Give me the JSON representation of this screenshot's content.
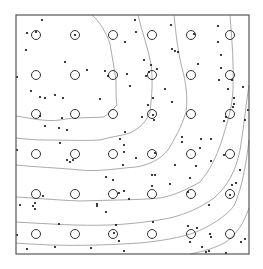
{
  "chart_data": {
    "type": "scatter",
    "title": "",
    "xlabel": "",
    "ylabel": "",
    "grid": false,
    "legend": null,
    "frame": {
      "x0": 16,
      "y0": 15,
      "x1": 249,
      "y1": 254,
      "color": "#555555"
    },
    "colors": {
      "points": "#111111",
      "circles": "#333333",
      "contours": "#a0a0a0"
    },
    "sample_grid": {
      "columns_px": [
        36,
        75,
        113,
        152,
        191,
        230
      ],
      "rows_px": [
        35,
        75,
        114,
        154,
        194,
        234
      ],
      "marker": "open-circle",
      "radius_px": 4.5
    },
    "series": [
      {
        "name": "points",
        "marker": "dot",
        "points_px": [
          [
            42,
            20
          ],
          [
            27,
            33
          ],
          [
            36,
            32
          ],
          [
            75,
            35
          ],
          [
            26,
            50
          ],
          [
            65,
            62
          ],
          [
            17,
            77
          ],
          [
            87,
            70
          ],
          [
            105,
            71
          ],
          [
            108,
            76
          ],
          [
            127,
            74
          ],
          [
            130,
            86
          ],
          [
            31,
            91
          ],
          [
            40,
            97
          ],
          [
            45,
            98
          ],
          [
            55,
            95
          ],
          [
            63,
            98
          ],
          [
            100,
            99
          ],
          [
            40,
            116
          ],
          [
            62,
            118
          ],
          [
            45,
            126
          ],
          [
            59,
            128
          ],
          [
            67,
            130
          ],
          [
            125,
            132
          ],
          [
            125,
            42
          ],
          [
            136,
            32
          ],
          [
            135,
            20
          ],
          [
            171,
            25
          ],
          [
            172,
            49
          ],
          [
            175,
            51
          ],
          [
            178,
            52
          ],
          [
            157,
            69
          ],
          [
            151,
            65
          ],
          [
            149,
            72
          ],
          [
            144,
            60
          ],
          [
            146,
            76
          ],
          [
            153,
            98
          ],
          [
            172,
            102
          ],
          [
            148,
            105
          ],
          [
            142,
            117
          ],
          [
            153,
            115
          ],
          [
            154,
            120
          ],
          [
            165,
            89
          ],
          [
            194,
            34
          ],
          [
            198,
            64
          ],
          [
            218,
            26
          ],
          [
            218,
            42
          ],
          [
            221,
            55
          ],
          [
            221,
            68
          ],
          [
            219,
            80
          ],
          [
            228,
            89
          ],
          [
            232,
            80
          ],
          [
            234,
            98
          ],
          [
            243,
            87
          ],
          [
            245,
            120
          ],
          [
            226,
            117
          ],
          [
            224,
            121
          ],
          [
            233,
            107
          ],
          [
            234,
            104
          ],
          [
            60,
            143
          ],
          [
            120,
            139
          ],
          [
            124,
            145
          ],
          [
            124,
            152
          ],
          [
            73,
            160
          ],
          [
            70,
            162
          ],
          [
            67,
            160
          ],
          [
            123,
            165
          ],
          [
            182,
            142
          ],
          [
            182,
            137
          ],
          [
            136,
            158
          ],
          [
            155,
            153
          ],
          [
            152,
            175
          ],
          [
            152,
            186
          ],
          [
            155,
            175
          ],
          [
            170,
            184
          ],
          [
            175,
            165
          ],
          [
            190,
            178
          ],
          [
            196,
            166
          ],
          [
            200,
            148
          ],
          [
            201,
            139
          ],
          [
            211,
            139
          ],
          [
            211,
            161
          ],
          [
            224,
            155
          ],
          [
            240,
            170
          ],
          [
            236,
            183
          ],
          [
            232,
            185
          ],
          [
            230,
            195
          ],
          [
            43,
            196
          ],
          [
            35,
            203
          ],
          [
            20,
            205
          ],
          [
            33,
            206
          ],
          [
            35,
            209
          ],
          [
            97,
            206
          ],
          [
            97,
            204
          ],
          [
            129,
            199
          ],
          [
            106,
            177
          ],
          [
            113,
            180
          ],
          [
            106,
            212
          ],
          [
            124,
            191
          ],
          [
            119,
            193
          ],
          [
            188,
            192
          ],
          [
            209,
            205
          ],
          [
            59,
            224
          ],
          [
            116,
            225
          ],
          [
            114,
            233
          ],
          [
            119,
            241
          ],
          [
            27,
            249
          ],
          [
            55,
            247
          ],
          [
            91,
            248
          ],
          [
            124,
            251
          ],
          [
            153,
            222
          ],
          [
            188,
            226
          ],
          [
            197,
            228
          ],
          [
            210,
            234
          ],
          [
            211,
            237
          ],
          [
            190,
            242
          ],
          [
            202,
            247
          ],
          [
            209,
            251
          ],
          [
            206,
            252
          ],
          [
            226,
            253
          ],
          [
            241,
            242
          ],
          [
            245,
            239
          ],
          [
            17,
            235
          ],
          [
            17,
            150
          ],
          [
            248,
            110
          ]
        ]
      }
    ],
    "contours_px": [
      "M92,15 C100,22 106,32 110,44 C112,55 114,68 116,80 C116,92 116,100 117,105 C112,110 108,114 104,117 C90,118 75,117 60,120 C45,122 30,118 16,116",
      "M138,15 C142,32 148,48 151,64 C153,80 152,95 150,112 C146,122 140,128 130,133 C120,136 110,137 100,140 C85,141 65,140 45,140 C35,140 25,139 16,138",
      "M174,15 C176,35 178,52 182,68 C186,82 188,98 186,112 C182,126 174,140 168,150 C160,160 148,165 136,167 C120,168 100,172 80,170 C60,168 35,167 16,165",
      "M230,15 C232,40 234,65 233,90 C232,108 228,120 222,140 C216,158 210,170 200,182 C186,190 172,196 160,198 C140,200 110,200 80,201 C55,200 35,198 16,197",
      "M249,85 C246,105 244,125 240,150 C236,170 228,186 214,198 C200,208 186,214 170,218 C150,222 130,224 110,225 C80,226 50,224 16,222",
      "M249,140 C246,165 242,188 234,206 C224,218 210,226 196,232 C180,238 160,241 140,243 C110,245 80,246 50,245 C35,244 25,244 16,243",
      "M249,208 C244,222 238,233 226,242 C215,248 205,251 190,254"
    ]
  }
}
